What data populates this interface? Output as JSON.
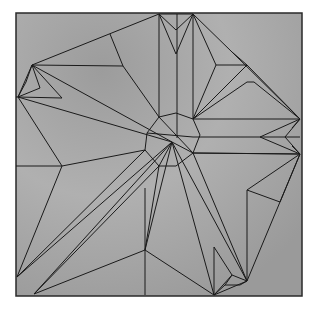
{
  "diagram": {
    "paper": {
      "x": 16,
      "y": 13,
      "width": 286,
      "height": 283
    },
    "colors": {
      "paper": "#a9a9a9",
      "paper_dark": "#8f8f8f",
      "line": "#1a1a1a",
      "frame": "#2a2a2a",
      "background": "#ffffff"
    },
    "lines": [
      [
        32,
        65,
        159,
        14
      ],
      [
        159,
        14,
        193,
        14
      ],
      [
        193,
        14,
        232,
        52
      ],
      [
        232,
        52,
        300,
        119
      ],
      [
        18,
        97,
        32,
        65
      ],
      [
        18,
        97,
        16,
        97
      ],
      [
        110,
        34,
        123,
        66
      ],
      [
        123,
        66,
        32,
        65
      ],
      [
        123,
        66,
        159,
        117
      ],
      [
        159,
        14,
        159,
        117
      ],
      [
        193,
        14,
        193,
        119
      ],
      [
        177,
        14,
        177,
        138
      ],
      [
        159,
        14,
        176,
        54
      ],
      [
        193,
        14,
        176,
        54
      ],
      [
        176,
        30,
        159,
        14
      ],
      [
        176,
        30,
        193,
        14
      ],
      [
        193,
        14,
        216,
        65
      ],
      [
        216,
        65,
        247,
        65
      ],
      [
        247,
        65,
        232,
        52
      ],
      [
        216,
        65,
        193,
        119
      ],
      [
        247,
        65,
        300,
        119
      ],
      [
        247,
        65,
        193,
        119
      ],
      [
        247,
        82,
        254,
        82
      ],
      [
        247,
        82,
        193,
        119
      ],
      [
        254,
        82,
        300,
        119
      ],
      [
        193,
        119,
        300,
        119
      ],
      [
        193,
        137,
        300,
        137
      ],
      [
        193,
        153,
        300,
        154
      ],
      [
        260,
        137,
        300,
        119
      ],
      [
        260,
        137,
        300,
        154
      ],
      [
        285,
        137,
        300,
        119
      ],
      [
        285,
        137,
        300,
        154
      ],
      [
        292,
        128,
        300,
        119
      ],
      [
        292,
        146,
        300,
        154
      ],
      [
        32,
        65,
        172,
        142
      ],
      [
        18,
        97,
        172,
        142
      ],
      [
        32,
        65,
        62,
        98
      ],
      [
        18,
        97,
        62,
        98
      ],
      [
        32,
        65,
        40,
        88
      ],
      [
        18,
        97,
        40,
        88
      ],
      [
        26,
        82,
        32,
        65
      ],
      [
        26,
        82,
        18,
        97
      ],
      [
        18,
        97,
        62,
        166
      ],
      [
        62,
        166,
        145,
        150
      ],
      [
        62,
        166,
        16,
        166
      ],
      [
        62,
        166,
        17,
        277
      ],
      [
        159,
        117,
        176,
        113
      ],
      [
        176,
        113,
        193,
        119
      ],
      [
        193,
        119,
        200,
        135
      ],
      [
        200,
        135,
        193,
        153
      ],
      [
        193,
        153,
        176,
        166
      ],
      [
        176,
        166,
        159,
        166
      ],
      [
        159,
        166,
        145,
        150
      ],
      [
        145,
        150,
        147,
        133
      ],
      [
        147,
        133,
        159,
        117
      ],
      [
        159,
        117,
        193,
        153
      ],
      [
        147,
        133,
        193,
        137
      ],
      [
        172,
        142,
        34,
        294
      ],
      [
        172,
        142,
        17,
        277
      ],
      [
        172,
        142,
        159,
        166
      ],
      [
        145,
        150,
        17,
        277
      ],
      [
        159,
        166,
        34,
        294
      ],
      [
        172,
        142,
        214,
        295
      ],
      [
        172,
        142,
        247,
        281
      ],
      [
        172,
        142,
        193,
        153
      ],
      [
        193,
        153,
        247,
        281
      ],
      [
        193,
        153,
        300,
        154
      ],
      [
        247,
        190,
        300,
        154
      ],
      [
        247,
        190,
        280,
        202
      ],
      [
        247,
        190,
        247,
        281
      ],
      [
        280,
        202,
        300,
        154
      ],
      [
        247,
        281,
        300,
        154
      ],
      [
        145,
        188,
        145,
        295
      ],
      [
        145,
        250,
        34,
        294
      ],
      [
        145,
        250,
        214,
        295
      ],
      [
        214,
        247,
        214,
        295
      ],
      [
        214,
        247,
        232,
        275
      ],
      [
        232,
        275,
        247,
        281
      ],
      [
        232,
        275,
        214,
        295
      ],
      [
        232,
        275,
        225,
        285
      ],
      [
        225,
        285,
        214,
        295
      ],
      [
        225,
        285,
        240,
        285
      ],
      [
        240,
        285,
        247,
        281
      ],
      [
        214,
        295,
        247,
        281
      ],
      [
        172,
        142,
        145,
        250
      ],
      [
        159,
        166,
        145,
        250
      ]
    ]
  }
}
